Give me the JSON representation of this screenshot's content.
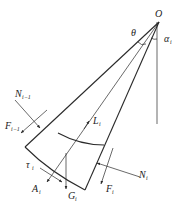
{
  "figure": {
    "stroke_color": "#2a2a2a",
    "background": "#ffffff"
  },
  "labels": {
    "origin": "O",
    "theta": "θ",
    "alpha": "α",
    "alpha_sub": "i",
    "N_prev": "N",
    "N_prev_sub": "i−1",
    "F_prev": "F",
    "F_prev_sub": "i−1",
    "L": "L",
    "L_sub": "i",
    "tau": "τ",
    "tau_sub": "i",
    "A": "A",
    "A_sub": "i",
    "G": "G",
    "G_sub": "i",
    "F": "F",
    "F_sub": "i",
    "N": "N",
    "N_sub": "i"
  }
}
